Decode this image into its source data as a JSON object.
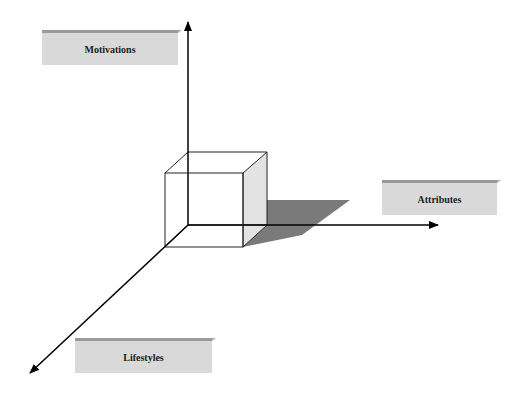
{
  "diagram": {
    "title": "",
    "axes": [
      {
        "id": "vertical",
        "label": "Motivations",
        "direction": "up"
      },
      {
        "id": "horizontal",
        "label": "Attributes",
        "direction": "right"
      },
      {
        "id": "depth",
        "label": "Lifestyles",
        "direction": "down-left"
      }
    ],
    "center_object": "cube-with-shadow",
    "colors": {
      "background": "#ffffff",
      "axis": "#000000",
      "label_box": "#d9d9d9",
      "cube_side": "#e3e3e3",
      "shadow": "#7a7a7a"
    }
  }
}
